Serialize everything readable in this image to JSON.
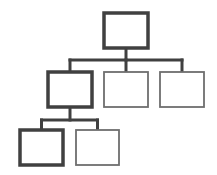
{
  "diagram": {
    "type": "org-chart-hierarchy",
    "colors": {
      "emphasis": "#404040",
      "normal": "#6e6e6e",
      "connector": "#404040",
      "fill": "#ffffff"
    },
    "nodes": [
      {
        "id": "root",
        "level": 0,
        "emphasized": true,
        "label": ""
      },
      {
        "id": "child-1",
        "level": 1,
        "parent": "root",
        "emphasized": true,
        "label": ""
      },
      {
        "id": "child-2",
        "level": 1,
        "parent": "root",
        "emphasized": false,
        "label": ""
      },
      {
        "id": "child-3",
        "level": 1,
        "parent": "root",
        "emphasized": false,
        "label": ""
      },
      {
        "id": "grandchild-1",
        "level": 2,
        "parent": "child-1",
        "emphasized": true,
        "label": ""
      },
      {
        "id": "grandchild-2",
        "level": 2,
        "parent": "child-1",
        "emphasized": false,
        "label": ""
      }
    ]
  }
}
